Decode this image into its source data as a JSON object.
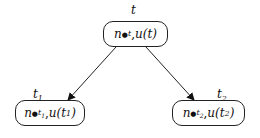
{
  "nodes": {
    "root": {
      "label": "t",
      "n_sym": "n",
      "n_sub": "t",
      "u_text": "u(t)"
    },
    "left": {
      "label": "t",
      "label_sub": "1",
      "n_sym": "n",
      "n_sub": "t",
      "n_subsub": "1",
      "u_pre": "u(t",
      "u_sub": "1",
      "u_post": ")"
    },
    "right": {
      "label": "t",
      "label_sub": "2",
      "n_sym": "n",
      "n_sub": "t",
      "n_subsub": "2",
      "u_pre": "u(t",
      "u_sub": "2",
      "u_post": ")"
    }
  },
  "edges": [
    {
      "from": "root",
      "to": "left"
    },
    {
      "from": "root",
      "to": "right"
    }
  ],
  "separator": ", "
}
